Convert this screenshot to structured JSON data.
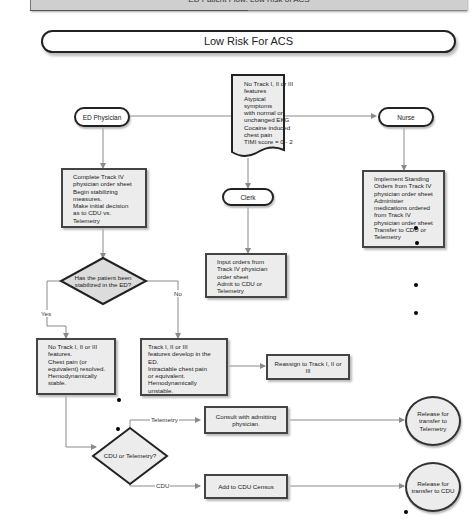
{
  "header": {
    "banner_text": "ED Patient Flow: Low Risk of ACS",
    "title": "Low Risk For ACS"
  },
  "start_document": {
    "lines": [
      "No Track I, II or III",
      "features",
      "Atypical symptoms",
      "with normal or",
      "unchanged EKG",
      "Cocaine induced",
      "chest pain",
      "TIMI score = 0 - 2"
    ]
  },
  "roles": {
    "ed_physician": "ED Physician",
    "clerk": "Clerk",
    "nurse": "Nurse"
  },
  "steps": {
    "physician_action": [
      "Complete Track IV",
      "physician order sheet",
      "Begin stabilizing",
      "measures.",
      "Make initial decision",
      "as to CDU vs.",
      "Telemetry"
    ],
    "clerk_action": [
      "Input orders from",
      "Track IV physician",
      "order sheet",
      "Admit to CDU or",
      "Telemetry"
    ],
    "nurse_action": [
      "Implement Standing",
      "Orders from Track IV",
      "physician order sheet",
      "Administer",
      "medications ordered",
      "from Track IV",
      "physician order sheet",
      "Transfer to CDU or",
      "Telemetry"
    ],
    "stable_outcome": [
      "No Track I, II or III",
      "features.",
      "Chest pain (or",
      "equivalent) resolved.",
      "Hemodynamically",
      "stable."
    ],
    "unstable_outcome": [
      "Track I, II or III",
      "features develop in the",
      "ED.",
      "Intractable chest pain",
      "or equivalent.",
      "Hemodynamically",
      "unstable."
    ],
    "reassign": "Reassign to Track I, II or III",
    "consult": "Consult with admitting physician.",
    "add_cdu": "Add to CDU Census"
  },
  "decisions": {
    "stabilized": "Has the patient been stabilized in the ED?",
    "cdu_or_tele": "CDU or Telemetry?"
  },
  "edge_labels": {
    "yes": "Yes",
    "no": "No",
    "telemetry": "Telemetry",
    "cdu": "CDU"
  },
  "endpoints": {
    "release_telemetry": "Release for transfer to Telemetry",
    "release_cdu": "Release for transfer to CDU"
  },
  "colors": {
    "box_fill": "#ececec",
    "border": "#444444",
    "connector": "#8a8a8a"
  }
}
